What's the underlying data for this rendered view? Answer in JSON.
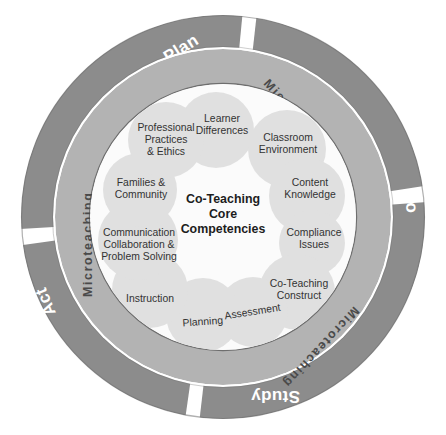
{
  "diagram": {
    "title": "Co-Teaching Core Competencies",
    "center_label_lines": [
      "Co-Teaching",
      "Core",
      "Competencies"
    ],
    "colors": {
      "outer_ring": "#8c8c8c",
      "inner_ring": "#b3b3b3",
      "ring_edge": "#6f6f6f",
      "core_fill": "#fbfbfb",
      "bubble_fill": "#d9d9d9",
      "background": "#ffffff",
      "ring_label_text": "#ffffff",
      "micro_label_text": "#4a4a4a",
      "bubble_label_text": "#333333"
    },
    "outer_cycle": {
      "name": "Plan-Do-Study-Act cycle",
      "segments": [
        {
          "label": "Plan",
          "position": "top"
        },
        {
          "label": "Do",
          "position": "right"
        },
        {
          "label": "Study",
          "position": "bottom"
        },
        {
          "label": "Act",
          "position": "left"
        }
      ]
    },
    "inner_ring": {
      "labels": [
        {
          "label": "Microteaching",
          "position": "upper-right"
        },
        {
          "label": "Microteaching",
          "position": "lower-right"
        },
        {
          "label": "Microteaching",
          "position": "lower-left"
        },
        {
          "label": "Microteaching",
          "position": "upper-left"
        }
      ]
    },
    "competency_bubbles": [
      {
        "lines": [
          "Learner",
          "Differences"
        ]
      },
      {
        "lines": [
          "Classroom",
          "Environment"
        ]
      },
      {
        "lines": [
          "Content",
          "Knowledge"
        ]
      },
      {
        "lines": [
          "Compliance",
          "Issues"
        ]
      },
      {
        "lines": [
          "Co-Teaching",
          "Construct"
        ]
      },
      {
        "lines": [
          "Assessment"
        ]
      },
      {
        "lines": [
          "Planning"
        ]
      },
      {
        "lines": [
          "Instruction"
        ]
      },
      {
        "lines": [
          "Communication",
          "Collaboration &",
          "Problem Solving"
        ]
      },
      {
        "lines": [
          "Families &",
          "Community"
        ]
      },
      {
        "lines": [
          "Professional",
          "Practices",
          "& Ethics"
        ]
      }
    ]
  }
}
